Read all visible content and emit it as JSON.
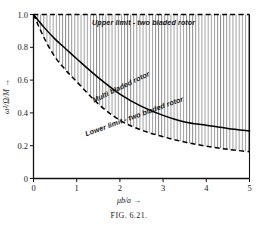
{
  "figure": {
    "caption": "FIG. 6.21."
  },
  "chart_data": {
    "type": "line",
    "title": "",
    "xlabel": "μb/a →",
    "ylabel": "ω²/Ω/M →",
    "xlim": [
      0,
      5
    ],
    "ylim": [
      0,
      1.0
    ],
    "xticks": [
      0,
      1,
      2,
      3,
      4,
      5
    ],
    "xticklabels": [
      "0",
      "1",
      "2",
      "3",
      "4",
      "5"
    ],
    "yticks": [
      0,
      0.2,
      0.4,
      0.6,
      0.8,
      1.0
    ],
    "yticklabels": [
      "0",
      "0.2",
      "0.4",
      "0.6",
      "0.8",
      "1.0"
    ],
    "grid": false,
    "legend_position": "inline-annotations",
    "shading": "vertical-hatch-between-upper-and-lower-limit",
    "series": [
      {
        "name": "Upper limit - two bladed rotor",
        "style": "dashed",
        "annotation": "Upper limit - two bladed rotor",
        "x": [
          0,
          0.5,
          1,
          1.5,
          2,
          2.5,
          3,
          3.5,
          4,
          4.5,
          5
        ],
        "values": [
          1.0,
          1.0,
          1.0,
          1.0,
          1.0,
          1.0,
          1.0,
          1.0,
          1.0,
          1.0,
          1.0
        ]
      },
      {
        "name": "Multi bladed rotor",
        "style": "solid",
        "annotation": "Multi bladed rotor",
        "x": [
          0,
          0.25,
          0.5,
          0.75,
          1,
          1.5,
          2,
          2.5,
          3,
          3.5,
          4,
          4.5,
          5
        ],
        "values": [
          1.0,
          0.92,
          0.85,
          0.79,
          0.73,
          0.615,
          0.515,
          0.44,
          0.385,
          0.345,
          0.325,
          0.305,
          0.29
        ]
      },
      {
        "name": "Lower limit - two bladed rotor",
        "style": "dashed",
        "annotation": "Lower limit - two bladed rotor",
        "x": [
          0,
          0.25,
          0.5,
          0.75,
          1,
          1.5,
          2,
          2.5,
          3,
          3.5,
          4,
          4.5,
          5
        ],
        "values": [
          1.0,
          0.855,
          0.74,
          0.66,
          0.59,
          0.455,
          0.355,
          0.295,
          0.255,
          0.222,
          0.197,
          0.178,
          0.163
        ]
      }
    ]
  },
  "colors": {
    "curve": "#000000",
    "axis": "#111111",
    "hatch": "#2a2a2a",
    "background": "#ffffff"
  }
}
